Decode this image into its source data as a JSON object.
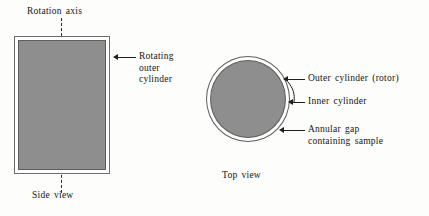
{
  "figure": {
    "title_caption_left": "Side view",
    "title_caption_right": "Top view",
    "background_color": "#fdfdfb",
    "fill_color": "#8e8e8e",
    "outline_color": "#5d5d5d",
    "gap_color": "#ffffff"
  },
  "side_view": {
    "axis_label": "Rotation axis",
    "axis_style": "dashed-vertical",
    "callout": "Rotating\nouter\ncylinder",
    "caption": "Side view"
  },
  "top_view": {
    "callouts": [
      {
        "label": "Outer cylinder (rotor)"
      },
      {
        "label": "Inner cylinder"
      },
      {
        "label": "Annular gap\ncontaining sample"
      }
    ],
    "caption": "Top view"
  },
  "icons": {
    "arrow": "arrow-left-icon",
    "leader": "leader-line-icon"
  }
}
